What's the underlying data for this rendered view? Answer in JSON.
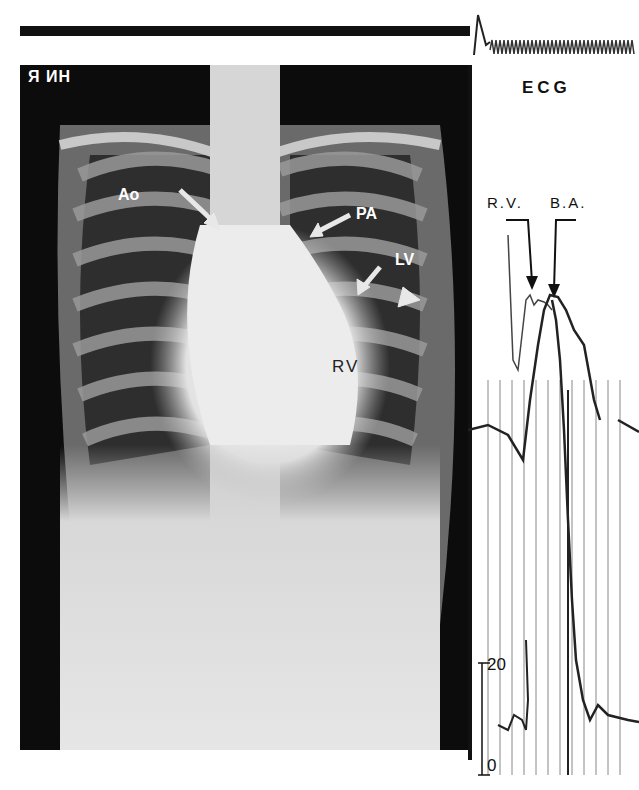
{
  "figure": {
    "xray": {
      "corner_marker": "Я ИН",
      "labels": {
        "aorta": "Ao",
        "pulmonary_artery": "PA",
        "left_ventricle": "LV",
        "right_ventricle": "RV"
      }
    },
    "trace": {
      "ecg_label": "ECG",
      "rv_label": "R.V.",
      "ba_label": "B.A.",
      "scale_top": "20",
      "scale_bottom": "0"
    }
  }
}
